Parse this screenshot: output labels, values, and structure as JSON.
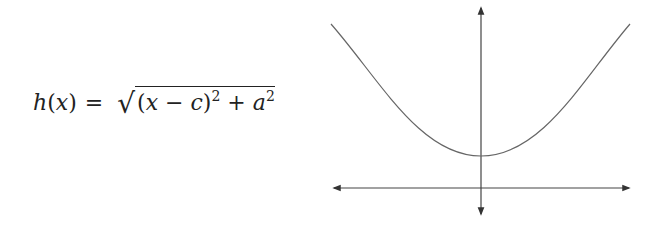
{
  "formula": {
    "lhs": "h(x)",
    "equals": "=",
    "radical": "√",
    "radicand_parts": [
      "(x − c)",
      "2",
      " + a",
      "2"
    ],
    "latex": "h(x) = \\sqrt{(x-c)^2 + a^2}"
  },
  "graph": {
    "description": "Plot of h(x) with vertex above origin on y-axis",
    "x_axis": {
      "x1": 332,
      "x2": 631,
      "y": 188,
      "arrows": "both"
    },
    "y_axis": {
      "x": 481,
      "y1": 6,
      "y2": 216,
      "arrows": "both"
    },
    "curve": {
      "type": "hyperbola-branch",
      "left": [
        331,
        24
      ],
      "vertex": [
        481,
        156
      ],
      "right": [
        630,
        24
      ]
    },
    "stroke_color": "#555555",
    "axis_color": "#333333"
  }
}
